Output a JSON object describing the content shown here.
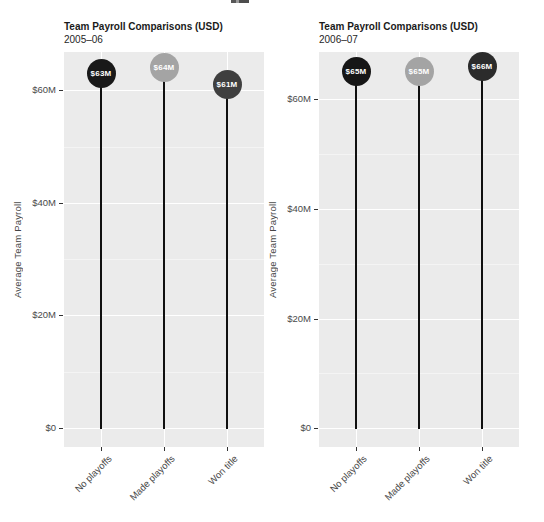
{
  "figure": {
    "background": "#ffffff",
    "panel_background": "#ebebeb",
    "y_axis_title": "Average Team Payroll"
  },
  "chart_data": [
    {
      "type": "lollipop",
      "title": "Team Payroll Comparisons (USD)",
      "subtitle": "2005–06",
      "categories": [
        "No playoffs",
        "Made playoffs",
        "Won title"
      ],
      "values": [
        63,
        64,
        61
      ],
      "value_labels": [
        "$63M",
        "$64M",
        "$61M"
      ],
      "colors": [
        "#191919",
        "#a4a4a4",
        "#3f3f3f"
      ],
      "ylabel": "Average Team Payroll",
      "y_ticks": [
        {
          "value": 0,
          "label": "$0"
        },
        {
          "value": 20,
          "label": "$20M"
        },
        {
          "value": 40,
          "label": "$40M"
        },
        {
          "value": 60,
          "label": "$60M"
        }
      ],
      "y_minor_ticks": [
        10,
        30,
        50
      ],
      "ylim": [
        -3.4,
        66.8
      ],
      "grid": true,
      "legend": "none",
      "stem_color": "#101010",
      "label_text_color": "#ffffff"
    },
    {
      "type": "lollipop",
      "title": "Team Payroll Comparisons (USD)",
      "subtitle": "2006–07",
      "categories": [
        "No playoffs",
        "Made playoffs",
        "Won title"
      ],
      "values": [
        65,
        65,
        66
      ],
      "value_labels": [
        "$65M",
        "$65M",
        "$66M"
      ],
      "colors": [
        "#161616",
        "#a4a4a4",
        "#2b2b2b"
      ],
      "ylabel": "Average Team Payroll",
      "y_ticks": [
        {
          "value": 0,
          "label": "$0"
        },
        {
          "value": 20,
          "label": "$20M"
        },
        {
          "value": 40,
          "label": "$40M"
        },
        {
          "value": 60,
          "label": "$60M"
        }
      ],
      "y_minor_ticks": [
        10,
        30,
        50
      ],
      "ylim": [
        -3.4,
        68.6
      ],
      "grid": true,
      "legend": "none",
      "stem_color": "#101010",
      "label_text_color": "#ffffff"
    }
  ]
}
